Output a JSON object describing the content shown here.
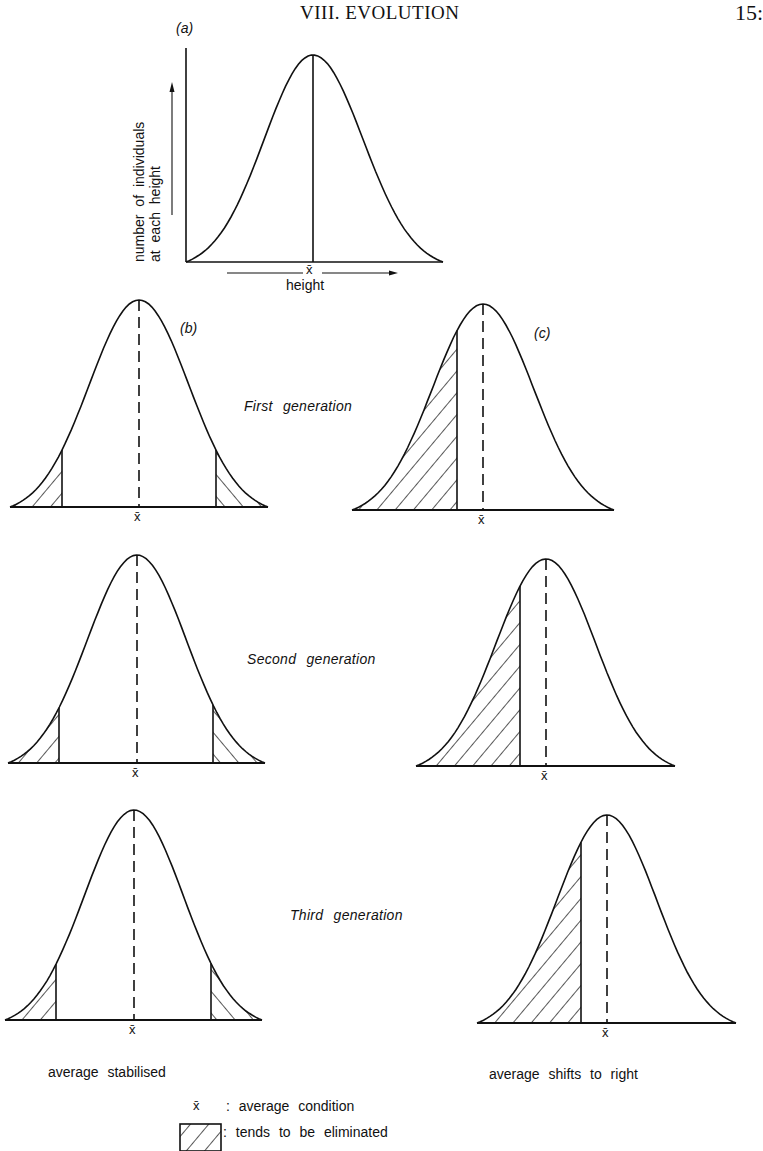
{
  "page": {
    "header_title": "VIII. EVOLUTION",
    "page_number": "15:"
  },
  "panels": {
    "a": {
      "label": "(a)",
      "y_axis_line1": "number of individuals",
      "y_axis_line2": "at each height",
      "x_axis_label": "height",
      "mean_symbol": "x̄"
    },
    "b": {
      "label": "(b)"
    },
    "c": {
      "label": "(c)"
    }
  },
  "generations": [
    {
      "label": "First generation"
    },
    {
      "label": "Second generation"
    },
    {
      "label": "Third generation"
    }
  ],
  "captions": {
    "left": "average stabilised",
    "right": "average shifts to right"
  },
  "legend": {
    "mean_symbol": "x̄",
    "mean_text": ": average condition",
    "hatch_text": ": tends to be eliminated"
  },
  "chart_data": {
    "type": "diagram",
    "curves": [
      {
        "panel": "a",
        "kind": "reference",
        "left": 186,
        "right": 443,
        "mean": 313,
        "peak_y": 55,
        "base_y": 262,
        "mean_line": "solid"
      },
      {
        "panel": "b",
        "generation": 1,
        "left": 10,
        "right": 268,
        "mean": 139,
        "peak_y": 300,
        "base_y": 507,
        "cutoffs": [
          62,
          216
        ],
        "eliminated": "both-tails"
      },
      {
        "panel": "c",
        "generation": 1,
        "left": 352,
        "right": 614,
        "mean": 483,
        "peak_y": 304,
        "base_y": 510,
        "cutoffs": [
          457
        ],
        "eliminated": "left-tail"
      },
      {
        "panel": "b",
        "generation": 2,
        "left": 8,
        "right": 265,
        "mean": 137,
        "peak_y": 555,
        "base_y": 763,
        "cutoffs": [
          59,
          213
        ],
        "eliminated": "both-tails"
      },
      {
        "panel": "c",
        "generation": 2,
        "left": 416,
        "right": 675,
        "mean": 546,
        "peak_y": 559,
        "base_y": 766,
        "cutoffs": [
          520
        ],
        "eliminated": "left-tail"
      },
      {
        "panel": "b",
        "generation": 3,
        "left": 5,
        "right": 262,
        "mean": 134,
        "peak_y": 810,
        "base_y": 1020,
        "cutoffs": [
          56,
          211
        ],
        "eliminated": "both-tails"
      },
      {
        "panel": "c",
        "generation": 3,
        "left": 477,
        "right": 736,
        "mean": 607,
        "peak_y": 815,
        "base_y": 1023,
        "cutoffs": [
          581
        ],
        "eliminated": "left-tail"
      }
    ],
    "legend": [
      "x̄ : average condition",
      "hatched : tends to be eliminated"
    ],
    "xlabel": "height",
    "ylabel": "number of individuals at each height"
  }
}
